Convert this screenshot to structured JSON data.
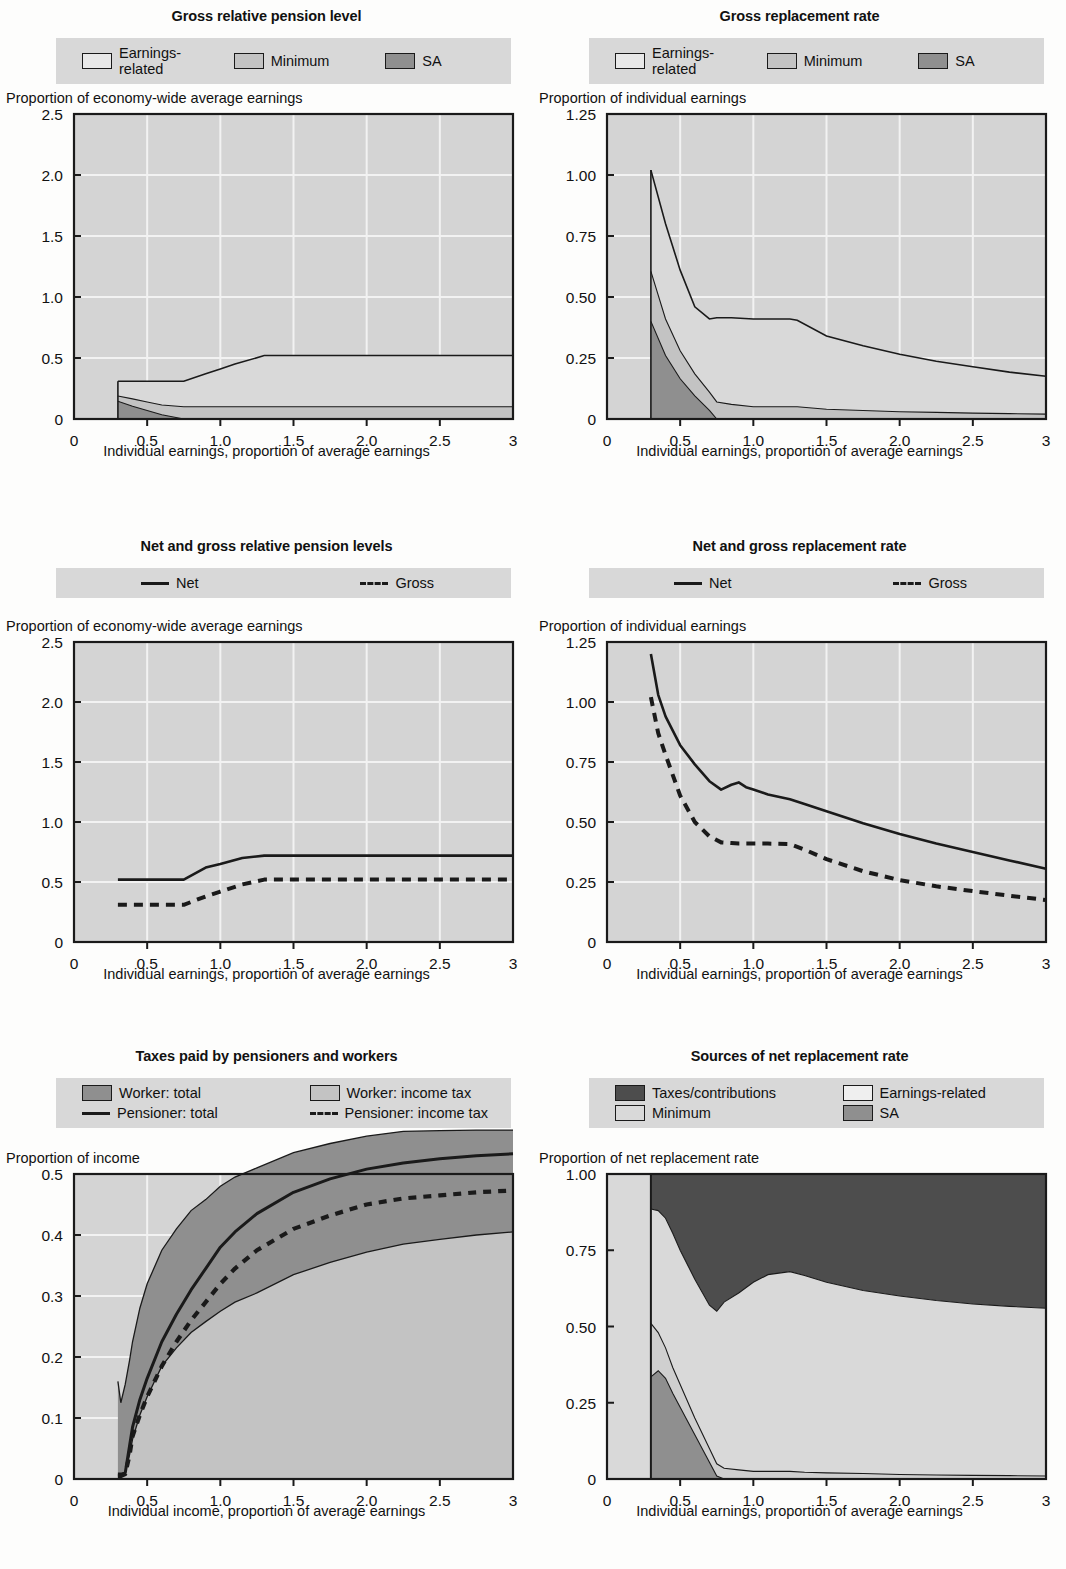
{
  "palette": {
    "earnings_related": "#d9d9d9",
    "minimum": "#c3c3c3",
    "sa": "#8f8f8f",
    "taxes_contributions": "#4d4d4d",
    "worker_total": "#8f8f8f",
    "worker_income_tax": "#c3c3c3",
    "plot_bg": "#d4d4d4",
    "legend_bg": "#d8d8d8",
    "axis": "#1a1a1a",
    "gridline": "#f2f2f2"
  },
  "panels": [
    {
      "id": "gross-relative-pension-level",
      "title": "Gross relative pension level",
      "legend_columns": 3,
      "legend": [
        {
          "label": "Earnings-related",
          "swatch": "swatch-box",
          "color": "#e8e8e8"
        },
        {
          "label": "Minimum",
          "swatch": "swatch-box",
          "color": "#c3c3c3"
        },
        {
          "label": "SA",
          "swatch": "swatch-box",
          "color": "#8f8f8f"
        }
      ],
      "ylabel": "Proportion of economy-wide average earnings",
      "xlabel": "Individual earnings, proportion of average earnings",
      "yticks": [
        "0",
        "0.5",
        "1.0",
        "1.5",
        "2.0",
        "2.5"
      ],
      "xticks": [
        "0",
        "0.5",
        "1.0",
        "1.5",
        "2.0",
        "2.5",
        "3"
      ]
    },
    {
      "id": "gross-replacement-rate",
      "title": "Gross replacement rate",
      "legend_columns": 3,
      "legend": [
        {
          "label": "Earnings-related",
          "swatch": "swatch-box",
          "color": "#e8e8e8"
        },
        {
          "label": "Minimum",
          "swatch": "swatch-box",
          "color": "#c3c3c3"
        },
        {
          "label": "SA",
          "swatch": "swatch-box",
          "color": "#8f8f8f"
        }
      ],
      "ylabel": "Proportion of individual earnings",
      "xlabel": "Individual earnings, proportion of average earnings",
      "yticks": [
        "0",
        "0.25",
        "0.50",
        "0.75",
        "1.00",
        "1.25"
      ],
      "xticks": [
        "0",
        "0.5",
        "1.0",
        "1.5",
        "2.0",
        "2.5",
        "3"
      ]
    },
    {
      "id": "net-and-gross-relative-pension-levels",
      "title": "Net and gross relative pension levels",
      "legend_columns": 2,
      "legend": [
        {
          "label": "Net",
          "swatch": "swatch-solid-line",
          "color": "#1a1a1a"
        },
        {
          "label": "Gross",
          "swatch": "swatch-dashed-line",
          "color": "#1a1a1a"
        }
      ],
      "ylabel": "Proportion of economy-wide average earnings",
      "xlabel": "Individual earnings, proportion of average earnings",
      "yticks": [
        "0",
        "0.5",
        "1.0",
        "1.5",
        "2.0",
        "2.5"
      ],
      "xticks": [
        "0",
        "0.5",
        "1.0",
        "1.5",
        "2.0",
        "2.5",
        "3"
      ]
    },
    {
      "id": "net-and-gross-replacement-rate",
      "title": "Net and gross replacement rate",
      "legend_columns": 2,
      "legend": [
        {
          "label": "Net",
          "swatch": "swatch-solid-line",
          "color": "#1a1a1a"
        },
        {
          "label": "Gross",
          "swatch": "swatch-dashed-line",
          "color": "#1a1a1a"
        }
      ],
      "ylabel": "Proportion of individual earnings",
      "xlabel": "Individual earnings, proportion of average earnings",
      "yticks": [
        "0",
        "0.25",
        "0.50",
        "0.75",
        "1.00",
        "1.25"
      ],
      "xticks": [
        "0",
        "0.5",
        "1.0",
        "1.5",
        "2.0",
        "2.5",
        "3"
      ]
    },
    {
      "id": "taxes-paid-by-pensioners-and-workers",
      "title": "Taxes paid by pensioners and workers",
      "legend_columns": 2,
      "legend": [
        {
          "label": "Worker: total",
          "swatch": "swatch-box",
          "color": "#8f8f8f"
        },
        {
          "label": "Worker: income tax",
          "swatch": "swatch-box",
          "color": "#c3c3c3"
        },
        {
          "label": "Pensioner: total",
          "swatch": "swatch-solid-line",
          "color": "#1a1a1a"
        },
        {
          "label": "Pensioner: income tax",
          "swatch": "swatch-dashed-line",
          "color": "#1a1a1a"
        }
      ],
      "ylabel": "Proportion of income",
      "xlabel": "Individual income, proportion of average earnings",
      "yticks": [
        "0",
        "0.1",
        "0.2",
        "0.3",
        "0.4",
        "0.5"
      ],
      "xticks": [
        "0",
        "0.5",
        "1.0",
        "1.5",
        "2.0",
        "2.5",
        "3"
      ]
    },
    {
      "id": "sources-of-net-replacement-rate",
      "title": "Sources of net replacement rate",
      "legend_columns": 2,
      "legend": [
        {
          "label": "Taxes/contributions",
          "swatch": "swatch-box",
          "color": "#4d4d4d"
        },
        {
          "label": "Earnings-related",
          "swatch": "swatch-box",
          "color": "#efefef"
        },
        {
          "label": "Minimum",
          "swatch": "swatch-box",
          "color": "#d9d9d9"
        },
        {
          "label": "SA",
          "swatch": "swatch-box",
          "color": "#8f8f8f"
        }
      ],
      "ylabel": "Proportion of net replacement rate",
      "xlabel": "Individual earnings, proportion of average earnings",
      "yticks": [
        "0",
        "0.25",
        "0.50",
        "0.75",
        "1.00"
      ],
      "xticks": [
        "0",
        "0.5",
        "1.0",
        "1.5",
        "2.0",
        "2.5",
        "3"
      ]
    }
  ],
  "chart_data": [
    {
      "type": "area",
      "id": "gross-relative-pension-level",
      "title": "Gross relative pension level",
      "xlabel": "Individual earnings, proportion of average earnings",
      "ylabel": "Proportion of economy-wide average earnings",
      "xlim": [
        0,
        3
      ],
      "ylim": [
        0,
        2.5
      ],
      "grid": true,
      "legend_position": "top",
      "x": [
        0.3,
        0.4,
        0.5,
        0.6,
        0.75,
        0.9,
        1.0,
        1.1,
        1.3,
        1.5,
        2.0,
        2.5,
        3.0
      ],
      "series": [
        {
          "name": "SA",
          "values": [
            0.145,
            0.105,
            0.07,
            0.035,
            0.0,
            0.0,
            0.0,
            0.0,
            0.0,
            0.0,
            0.0,
            0.0,
            0.0
          ]
        },
        {
          "name": "Minimum",
          "values": [
            0.043,
            0.06,
            0.07,
            0.08,
            0.1,
            0.1,
            0.1,
            0.1,
            0.1,
            0.1,
            0.1,
            0.1,
            0.1
          ]
        },
        {
          "name": "Earnings-related",
          "values": [
            0.122,
            0.145,
            0.16,
            0.19,
            0.21,
            0.27,
            0.31,
            0.35,
            0.42,
            0.42,
            0.42,
            0.42,
            0.42
          ]
        }
      ],
      "total_top": [
        0.31,
        0.31,
        0.31,
        0.31,
        0.31,
        0.37,
        0.41,
        0.45,
        0.52,
        0.52,
        0.52,
        0.52,
        0.52
      ]
    },
    {
      "type": "area",
      "id": "gross-replacement-rate",
      "title": "Gross replacement rate",
      "xlabel": "Individual earnings, proportion of average earnings",
      "ylabel": "Proportion of individual earnings",
      "xlim": [
        0,
        3
      ],
      "ylim": [
        0,
        1.25
      ],
      "grid": true,
      "legend_position": "top",
      "x": [
        0.3,
        0.4,
        0.5,
        0.6,
        0.7,
        0.75,
        0.85,
        1.0,
        1.1,
        1.25,
        1.3,
        1.5,
        1.75,
        2.0,
        2.25,
        2.5,
        2.75,
        3.0
      ],
      "series": [
        {
          "name": "SA",
          "values": [
            0.4,
            0.26,
            0.165,
            0.095,
            0.035,
            0.0,
            0.0,
            0.0,
            0.0,
            0.0,
            0.0,
            0.0,
            0.0,
            0.0,
            0.0,
            0.0,
            0.0
          ]
        },
        {
          "name": "Minimum",
          "values": [
            0.205,
            0.15,
            0.115,
            0.09,
            0.075,
            0.07,
            0.06,
            0.05,
            0.05,
            0.05,
            0.05,
            0.04,
            0.035,
            0.03,
            0.027,
            0.024,
            0.022,
            0.02
          ]
        },
        {
          "name": "Earnings-related",
          "values": [
            0.415,
            0.39,
            0.33,
            0.275,
            0.3,
            0.345,
            0.355,
            0.36,
            0.36,
            0.36,
            0.355,
            0.3,
            0.265,
            0.235,
            0.21,
            0.19,
            0.17,
            0.155
          ]
        }
      ],
      "total_top": [
        1.02,
        0.8,
        0.61,
        0.46,
        0.41,
        0.415,
        0.415,
        0.41,
        0.41,
        0.41,
        0.405,
        0.34,
        0.3,
        0.265,
        0.237,
        0.214,
        0.192,
        0.175
      ]
    },
    {
      "type": "line",
      "id": "net-and-gross-relative-pension-levels",
      "title": "Net and gross relative pension levels",
      "xlabel": "Individual earnings, proportion of average earnings",
      "ylabel": "Proportion of economy-wide average earnings",
      "xlim": [
        0,
        3
      ],
      "ylim": [
        0,
        2.5
      ],
      "grid": true,
      "legend_position": "top",
      "x": [
        0.3,
        0.5,
        0.75,
        0.9,
        1.0,
        1.15,
        1.3,
        1.5,
        2.0,
        2.5,
        3.0
      ],
      "series": [
        {
          "name": "Net",
          "style": "solid",
          "values": [
            0.52,
            0.52,
            0.52,
            0.62,
            0.65,
            0.7,
            0.72,
            0.72,
            0.72,
            0.72,
            0.72
          ]
        },
        {
          "name": "Gross",
          "style": "dashed",
          "values": [
            0.31,
            0.31,
            0.31,
            0.38,
            0.42,
            0.48,
            0.52,
            0.52,
            0.52,
            0.52,
            0.52
          ]
        }
      ]
    },
    {
      "type": "line",
      "id": "net-and-gross-replacement-rate",
      "title": "Net and gross replacement rate",
      "xlabel": "Individual earnings, proportion of average earnings",
      "ylabel": "Proportion of individual earnings",
      "xlim": [
        0,
        3
      ],
      "ylim": [
        0,
        1.25
      ],
      "grid": true,
      "legend_position": "top",
      "x": [
        0.3,
        0.35,
        0.4,
        0.5,
        0.6,
        0.7,
        0.78,
        0.85,
        0.9,
        0.95,
        1.0,
        1.1,
        1.25,
        1.35,
        1.5,
        1.75,
        2.0,
        2.25,
        2.5,
        2.75,
        3.0
      ],
      "series": [
        {
          "name": "Net",
          "style": "solid",
          "values": [
            1.2,
            1.03,
            0.94,
            0.82,
            0.74,
            0.67,
            0.635,
            0.655,
            0.665,
            0.645,
            0.635,
            0.615,
            0.595,
            0.575,
            0.545,
            0.495,
            0.45,
            0.41,
            0.375,
            0.34,
            0.305
          ]
        },
        {
          "name": "Gross",
          "style": "dashed",
          "values": [
            1.02,
            0.87,
            0.78,
            0.61,
            0.5,
            0.44,
            0.415,
            0.412,
            0.41,
            0.41,
            0.41,
            0.41,
            0.408,
            0.385,
            0.345,
            0.295,
            0.258,
            0.232,
            0.212,
            0.193,
            0.175
          ]
        }
      ]
    },
    {
      "type": "area",
      "id": "taxes-paid-by-pensioners-and-workers",
      "title": "Taxes paid by pensioners and workers",
      "xlabel": "Individual income, proportion of average earnings",
      "ylabel": "Proportion of income",
      "xlim": [
        0,
        3
      ],
      "ylim": [
        0,
        0.5
      ],
      "grid": true,
      "legend_position": "top",
      "x": [
        0.3,
        0.32,
        0.35,
        0.38,
        0.4,
        0.45,
        0.5,
        0.6,
        0.7,
        0.8,
        0.9,
        1.0,
        1.1,
        1.25,
        1.5,
        1.75,
        2.0,
        2.25,
        2.5,
        2.75,
        3.0
      ],
      "series": [
        {
          "name": "Worker: income tax",
          "values": [
            0.005,
            0.005,
            0.01,
            0.04,
            0.065,
            0.105,
            0.135,
            0.185,
            0.215,
            0.24,
            0.258,
            0.275,
            0.29,
            0.305,
            0.335,
            0.355,
            0.372,
            0.385,
            0.393,
            0.4,
            0.405
          ]
        },
        {
          "name": "Worker: total",
          "values": [
            0.155,
            0.12,
            0.145,
            0.155,
            0.16,
            0.175,
            0.185,
            0.19,
            0.195,
            0.2,
            0.2,
            0.205,
            0.205,
            0.205,
            0.2,
            0.195,
            0.19,
            0.185,
            0.178,
            0.172,
            0.167
          ]
        }
      ],
      "worker_total_top": [
        0.16,
        0.125,
        0.155,
        0.195,
        0.225,
        0.28,
        0.32,
        0.375,
        0.41,
        0.44,
        0.458,
        0.48,
        0.495,
        0.51,
        0.535,
        0.55,
        0.562,
        0.57,
        0.571,
        0.572,
        0.572
      ],
      "lines": [
        {
          "name": "Pensioner: total",
          "style": "solid",
          "values": [
            0.008,
            0.008,
            0.01,
            0.055,
            0.085,
            0.13,
            0.165,
            0.225,
            0.27,
            0.31,
            0.345,
            0.38,
            0.405,
            0.435,
            0.47,
            0.492,
            0.508,
            0.518,
            0.525,
            0.53,
            0.533
          ]
        },
        {
          "name": "Pensioner: income tax",
          "style": "dashed",
          "values": [
            0.005,
            0.005,
            0.008,
            0.04,
            0.07,
            0.105,
            0.135,
            0.185,
            0.225,
            0.26,
            0.29,
            0.32,
            0.345,
            0.375,
            0.41,
            0.432,
            0.45,
            0.46,
            0.465,
            0.47,
            0.473
          ]
        }
      ]
    },
    {
      "type": "area",
      "id": "sources-of-net-replacement-rate",
      "title": "Sources of net replacement rate",
      "xlabel": "Individual earnings, proportion of average earnings",
      "ylabel": "Proportion of net replacement rate",
      "xlim": [
        0,
        3
      ],
      "ylim": [
        0,
        1.0
      ],
      "grid": true,
      "legend_position": "top",
      "x": [
        0.3,
        0.35,
        0.4,
        0.45,
        0.5,
        0.6,
        0.7,
        0.75,
        0.8,
        0.9,
        1.0,
        1.1,
        1.25,
        1.35,
        1.5,
        1.75,
        2.0,
        2.25,
        2.5,
        2.75,
        3.0
      ],
      "series": [
        {
          "name": "SA",
          "values": [
            0.335,
            0.355,
            0.33,
            0.28,
            0.235,
            0.145,
            0.055,
            0.01,
            0.0,
            0.0,
            0.0,
            0.0,
            0.0,
            0.0,
            0.0,
            0.0,
            0.0,
            0.0,
            0.0,
            0.0,
            0.0
          ]
        },
        {
          "name": "Minimum",
          "values": [
            0.175,
            0.125,
            0.1,
            0.085,
            0.075,
            0.055,
            0.045,
            0.04,
            0.035,
            0.03,
            0.025,
            0.025,
            0.025,
            0.022,
            0.02,
            0.018,
            0.015,
            0.013,
            0.012,
            0.011,
            0.01
          ]
        },
        {
          "name": "Earnings-related",
          "values": [
            0.375,
            0.4,
            0.425,
            0.44,
            0.44,
            0.455,
            0.47,
            0.5,
            0.545,
            0.58,
            0.62,
            0.645,
            0.655,
            0.645,
            0.625,
            0.6,
            0.585,
            0.572,
            0.562,
            0.555,
            0.55
          ]
        },
        {
          "name": "Taxes/contributions",
          "values": [
            0.115,
            0.12,
            0.145,
            0.195,
            0.25,
            0.345,
            0.43,
            0.45,
            0.42,
            0.39,
            0.355,
            0.33,
            0.32,
            0.333,
            0.355,
            0.382,
            0.4,
            0.415,
            0.426,
            0.434,
            0.44
          ]
        }
      ],
      "stack_top": [
        0.885,
        0.88,
        0.855,
        0.805,
        0.75,
        0.655,
        0.57,
        0.55,
        0.58,
        0.61,
        0.645,
        0.67,
        0.68,
        0.667,
        0.645,
        0.618,
        0.6,
        0.585,
        0.574,
        0.566,
        0.56
      ]
    }
  ]
}
